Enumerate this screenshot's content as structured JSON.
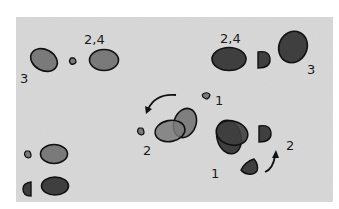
{
  "diagram": {
    "background": {
      "panel_color": "#d9d9d9",
      "page_color": "#ffffff"
    },
    "colors": {
      "light_shape": "#7a7a7a",
      "dark_shape": "#3f3f3f",
      "outline": "#111111"
    },
    "labels": {
      "top_left_24": "2,4",
      "top_left_3": "3",
      "top_right_24": "2,4",
      "top_right_3": "3",
      "mid_1": "1",
      "mid_2": "2",
      "right_1": "1",
      "right_2": "2"
    },
    "groups": [
      {
        "name": "top-left-light-footprint",
        "labels": [
          "2,4",
          "3"
        ]
      },
      {
        "name": "top-right-dark-footprint",
        "labels": [
          "2,4",
          "3"
        ]
      },
      {
        "name": "middle-light-overlap",
        "labels": [
          "1",
          "2"
        ],
        "arrow": "curved-left-down"
      },
      {
        "name": "right-dark-overlap",
        "labels": [
          "1",
          "2"
        ],
        "arrow": "curved-up"
      },
      {
        "name": "bottom-left-pair",
        "labels": []
      }
    ]
  }
}
